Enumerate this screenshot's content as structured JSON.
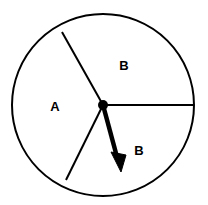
{
  "figure": {
    "name": "spinner-diagram",
    "type": "spinner",
    "background_color": "#ffffff",
    "stroke_color": "#000000"
  },
  "circle": {
    "center_x": 103,
    "center_y": 105,
    "radius": 91,
    "stroke_width": 2,
    "fill": "none"
  },
  "sectors": [
    {
      "id": "sector-a",
      "label": "A",
      "label_x": 55,
      "label_y": 108,
      "start_angle_deg": 145,
      "end_angle_deg": 234
    },
    {
      "id": "sector-b-top",
      "label": "B",
      "label_x": 124,
      "label_y": 67,
      "start_angle_deg": 0,
      "end_angle_deg": 145
    },
    {
      "id": "sector-b-bottom",
      "label": "B",
      "label_x": 139,
      "label_y": 152,
      "start_angle_deg": 234,
      "end_angle_deg": 360
    }
  ],
  "radii": [
    {
      "id": "radius-right",
      "x1": 103,
      "y1": 105,
      "x2": 194,
      "y2": 105,
      "stroke_width": 2
    },
    {
      "id": "radius-upper-left",
      "x1": 103,
      "y1": 105,
      "x2": 62,
      "y2": 32,
      "stroke_width": 2
    },
    {
      "id": "radius-lower-left",
      "x1": 103,
      "y1": 105,
      "x2": 66,
      "y2": 180,
      "stroke_width": 2
    }
  ],
  "pointer": {
    "id": "spinner-arrow",
    "pivot_x": 103,
    "pivot_y": 105,
    "tip_x": 121,
    "tip_y": 170,
    "angle_deg": 74,
    "shaft_width": 4,
    "arrowhead_length": 16,
    "arrowhead_width": 11,
    "hub_radius": 5,
    "color": "#000000"
  },
  "labels": {
    "a": "A",
    "b_top": "B",
    "b_bottom": "B"
  }
}
